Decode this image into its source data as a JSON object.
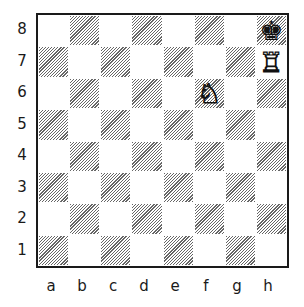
{
  "diagram": {
    "type": "chess-position",
    "files": [
      "a",
      "b",
      "c",
      "d",
      "e",
      "f",
      "g",
      "h"
    ],
    "ranks": [
      "8",
      "7",
      "6",
      "5",
      "4",
      "3",
      "2",
      "1"
    ],
    "square_style": {
      "light": "#ffffff",
      "dark": "hatched"
    },
    "pieces": [
      {
        "square": "h8",
        "piece": "king",
        "color": "black",
        "glyph": "♚"
      },
      {
        "square": "h7",
        "piece": "rook",
        "color": "white",
        "glyph": "♖"
      },
      {
        "square": "f6",
        "piece": "knight",
        "color": "white",
        "glyph": "♘"
      }
    ]
  }
}
